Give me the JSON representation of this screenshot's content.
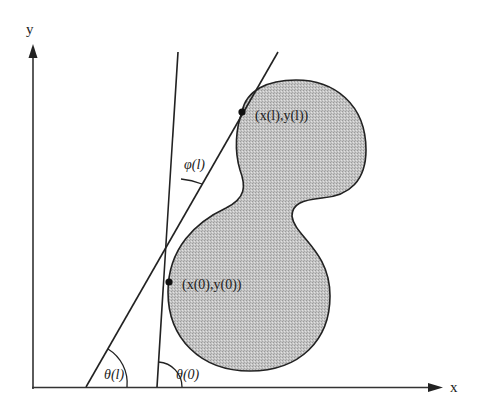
{
  "diagram": {
    "type": "geometric-figure",
    "colors": {
      "stroke": "#222222",
      "fill": "#bdbdbd",
      "background": "#ffffff"
    },
    "axes": {
      "x_label": "x",
      "y_label": "y"
    },
    "points": [
      {
        "id": "p_l",
        "label": "(x(l),y(l))",
        "x": 242,
        "y": 112
      },
      {
        "id": "p_0",
        "label": "(x(0),y(0))",
        "x": 169,
        "y": 282
      }
    ],
    "lines": [
      {
        "id": "tangent_0",
        "description": "tangent line through (x(0),y(0))",
        "from": [
          157,
          387
        ],
        "to": [
          178,
          52
        ]
      },
      {
        "id": "tangent_l",
        "description": "tangent line through (x(l),y(l))",
        "from": [
          86,
          387
        ],
        "to": [
          278,
          52
        ]
      }
    ],
    "angles": [
      {
        "id": "theta_l",
        "label": "θ(l)",
        "vertex": [
          86,
          387
        ]
      },
      {
        "id": "theta_0",
        "label": "θ(0)",
        "vertex": [
          157,
          387
        ]
      },
      {
        "id": "phi_l",
        "label": "φ(l)",
        "description": "angle between the two tangent lines"
      }
    ]
  }
}
